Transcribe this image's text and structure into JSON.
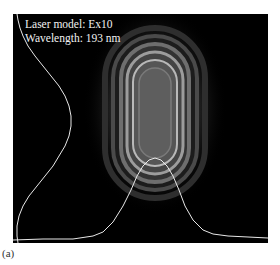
{
  "figure": {
    "annotations": {
      "laser_model": "Laser model: Ex10",
      "wavelength": "Wavelength: 193 nm"
    },
    "caption": "(a)",
    "colors": {
      "background": "#000000",
      "profile_line": "#e8e8e8",
      "beam_center": "#5a5a5a",
      "beam_ring": "#b0b0b0",
      "page": "#ffffff"
    },
    "beam_image": {
      "shape": "elongated vertical oval with concentric rings",
      "colormap": "grayscale"
    },
    "profiles": {
      "vertical": "intensity profile along left edge, peaking mid-height",
      "horizontal": "intensity profile along bottom edge, peaking under beam center"
    }
  }
}
